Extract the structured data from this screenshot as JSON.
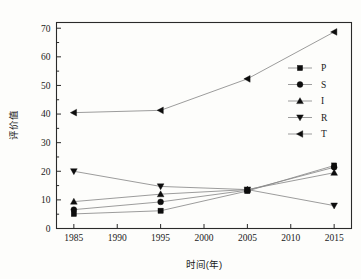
{
  "chart_data": {
    "type": "line",
    "title": "",
    "xlabel": "时间(年)",
    "ylabel": "评价值",
    "x": [
      1985,
      1995,
      2005,
      2015
    ],
    "xlim": [
      1983,
      2017
    ],
    "ylim": [
      0,
      72
    ],
    "xticks": [
      1985,
      1990,
      1995,
      2000,
      2005,
      2010,
      2015
    ],
    "xtick_labels": [
      "1985",
      "1990",
      "1995",
      "2000",
      "2005",
      "2010",
      "2015"
    ],
    "yticks": [
      0,
      10,
      20,
      30,
      40,
      50,
      60,
      70
    ],
    "ytick_labels": [
      "0",
      "10",
      "20",
      "30",
      "40",
      "50",
      "60",
      "70"
    ],
    "grid": false,
    "legend_position": "upper-right",
    "series": [
      {
        "name": "P",
        "marker": "square",
        "values": [
          5.1,
          6.2,
          13.1,
          22.0
        ]
      },
      {
        "name": "S",
        "marker": "circle",
        "values": [
          6.6,
          9.3,
          13.4,
          21.4
        ]
      },
      {
        "name": "I",
        "marker": "triangle-up",
        "values": [
          9.4,
          12.0,
          13.6,
          19.5
        ]
      },
      {
        "name": "R",
        "marker": "triangle-down",
        "values": [
          20.0,
          14.7,
          13.6,
          8.0
        ]
      },
      {
        "name": "T",
        "marker": "triangle-left",
        "values": [
          40.5,
          41.3,
          52.3,
          68.7
        ]
      }
    ]
  },
  "legend": {
    "entries": [
      {
        "label": "P"
      },
      {
        "label": "S"
      },
      {
        "label": "I"
      },
      {
        "label": "R"
      },
      {
        "label": "T"
      }
    ]
  },
  "colors": {
    "marker": "#0d0d0d",
    "line": "#8a8a8a",
    "axis": "#2a2a2a",
    "background": "#fdfdfb"
  }
}
